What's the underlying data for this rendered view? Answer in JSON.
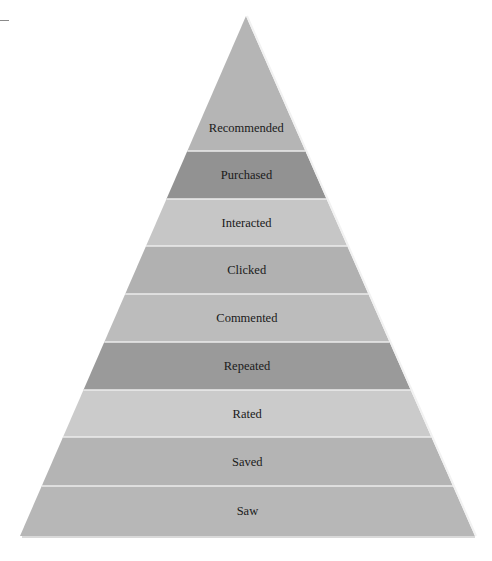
{
  "diagram": {
    "type": "pyramid",
    "apex": {
      "x": 246,
      "y": 16
    },
    "base": {
      "left": 20,
      "right": 475,
      "y": 536
    },
    "tiers": [
      {
        "label": "Recommended",
        "color": "#b5b5b5"
      },
      {
        "label": "Purchased",
        "color": "#929292"
      },
      {
        "label": "Interacted",
        "color": "#c6c6c6"
      },
      {
        "label": "Clicked",
        "color": "#b1b1b1"
      },
      {
        "label": "Commented",
        "color": "#bcbcbc"
      },
      {
        "label": "Repeated",
        "color": "#9a9a9a"
      },
      {
        "label": "Rated",
        "color": "#cbcbcb"
      },
      {
        "label": "Saved",
        "color": "#b4b4b4"
      },
      {
        "label": "Saw",
        "color": "#b7b7b7"
      }
    ],
    "tier_boundaries_y": [
      104,
      151,
      199,
      246,
      294,
      342,
      390,
      437,
      486,
      536
    ],
    "top_fill_color": "#b5b5b5",
    "separator_color": "#ececec",
    "edge_highlight_color": "#f2f2f2"
  }
}
